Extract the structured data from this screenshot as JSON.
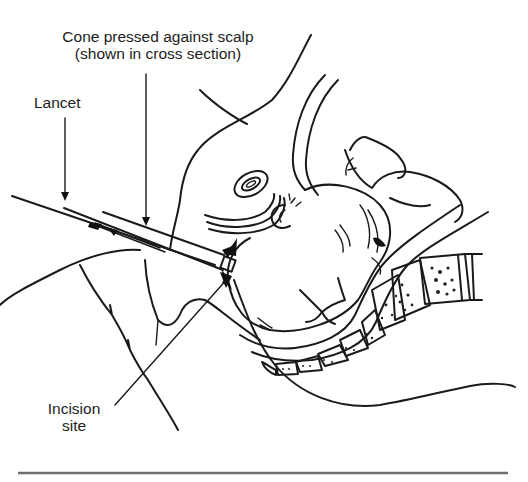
{
  "diagram": {
    "labels": {
      "cone": {
        "line1": "Cone pressed against scalp",
        "line2": "(shown in cross section)"
      },
      "lancet": "Lancet",
      "incision": {
        "line1": "Incision",
        "line2": "site"
      }
    },
    "structures": [
      "maternal pelvis (cross section)",
      "fetal head",
      "fetal arm and hand",
      "fetal ear",
      "umbilicus / symphysis",
      "sacrum and coccyx vertebrae",
      "vaginal canal",
      "amnioscope cone",
      "lancet"
    ],
    "colors": {
      "line": "#1a1a1a",
      "background": "#ffffff",
      "rule": "#6e6e6e"
    }
  }
}
